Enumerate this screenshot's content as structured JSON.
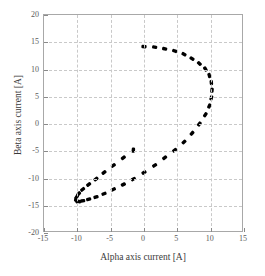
{
  "chart_data": {
    "type": "scatter",
    "title": "",
    "xlabel": "Alpha axis current [A]",
    "ylabel": "Beta axis current [A]",
    "xlim": [
      -15,
      15
    ],
    "ylim": [
      -20,
      20
    ],
    "xticks": [
      -15,
      -10,
      -5,
      0,
      5,
      10,
      15
    ],
    "yticks": [
      -20,
      -15,
      -10,
      -5,
      0,
      5,
      10,
      15,
      20
    ],
    "xtick_labels": [
      "-15",
      "-10",
      "-5",
      "0",
      "5",
      "10",
      "15"
    ],
    "ytick_labels": [
      "-20",
      "-15",
      "-10",
      "-5",
      "0",
      "5",
      "10",
      "15",
      "20"
    ],
    "grid": true,
    "grid_style": "dashed",
    "grid_color": "#c9c9c9",
    "legend": "none",
    "marker_color": "#000000",
    "marker_style": "thick-dash",
    "marker_count": 40,
    "series": [
      {
        "name": "Current vector locus",
        "description": "Closed circular locus of the stator current vector in the alpha-beta stationary reference frame",
        "shape": "circle",
        "center": [
          0,
          0
        ],
        "radius": 14,
        "radius_x": 10.2,
        "radius_y": 14.2,
        "x": [
          0.0,
          1.6,
          3.1,
          4.6,
          6.0,
          7.2,
          8.3,
          9.2,
          9.8,
          10.1,
          10.2,
          10.1,
          9.8,
          9.2,
          8.3,
          7.2,
          6.0,
          4.6,
          3.1,
          1.6,
          0.0,
          -1.6,
          -3.1,
          -4.6,
          -6.0,
          -7.2,
          -8.3,
          -9.2,
          -9.8,
          -10.1,
          -10.2,
          -10.1,
          -9.8,
          -9.2,
          -8.3,
          -7.2,
          -6.0,
          -4.6,
          -3.1,
          -1.6
        ],
        "y": [
          14.2,
          14.1,
          13.8,
          13.4,
          12.8,
          12.0,
          11.1,
          10.1,
          8.9,
          7.6,
          6.2,
          4.8,
          3.3,
          1.7,
          0.0,
          -1.7,
          -3.3,
          -4.8,
          -6.2,
          -7.6,
          -8.9,
          -10.1,
          -11.1,
          -12.0,
          -12.8,
          -13.4,
          -13.8,
          -14.1,
          -14.2,
          -14.1,
          -13.8,
          -13.4,
          -12.8,
          -12.0,
          -11.1,
          -10.1,
          -8.9,
          -7.6,
          -6.2,
          -4.8
        ]
      }
    ]
  },
  "axes": {
    "x_title": "Alpha axis current [A]",
    "y_title": "Beta axis current [A]"
  }
}
